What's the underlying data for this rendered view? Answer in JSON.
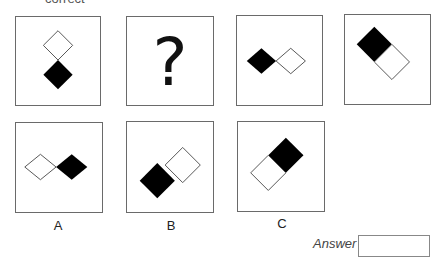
{
  "header": {
    "instruction_fragment": "correct"
  },
  "question_row": [
    {
      "id": "q1",
      "content": "diamond-pair-vertical",
      "top": "white",
      "bottom": "black"
    },
    {
      "id": "q2",
      "content": "question-mark",
      "symbol": "?"
    },
    {
      "id": "q3",
      "content": "diamond-pair-horizontal",
      "left": "black",
      "right": "white"
    },
    {
      "id": "q4",
      "content": "square-pair-diagonal",
      "upper_left": "black",
      "lower_right": "white"
    }
  ],
  "options": [
    {
      "label": "A",
      "content": "diamond-pair-horizontal",
      "left": "white",
      "right": "black"
    },
    {
      "label": "B",
      "content": "square-pair-diagonal",
      "lower_left": "black",
      "upper_right": "white"
    },
    {
      "label": "C",
      "content": "square-pair-diagonal",
      "upper_right": "black",
      "lower_left": "white"
    }
  ],
  "answer": {
    "label": "Answer",
    "value": ""
  },
  "colors": {
    "fill": "#000000",
    "outline": "#6a6a6a",
    "background": "#ffffff"
  }
}
